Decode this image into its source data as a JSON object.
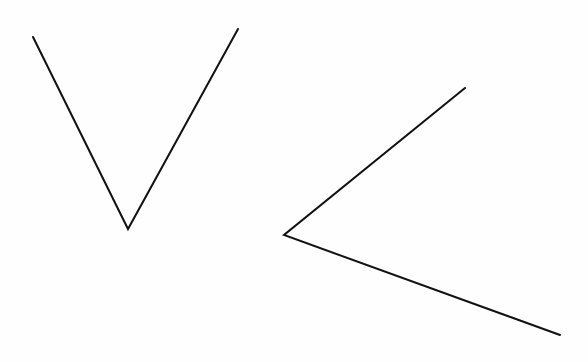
{
  "canvas": {
    "width": 588,
    "height": 362,
    "background": "#fefefe",
    "stroke_color": "#111111",
    "stroke_width": 2
  },
  "shapes": [
    {
      "name": "angle-v",
      "description": "V-shaped angle opening upward",
      "vertex": [
        128,
        229
      ],
      "arm_endpoints": [
        [
          33,
          37
        ],
        [
          238,
          29
        ]
      ]
    },
    {
      "name": "angle-left",
      "description": "Angle opening to the right",
      "vertex": [
        284,
        235
      ],
      "arm_endpoints": [
        [
          465,
          88
        ],
        [
          560,
          335
        ]
      ]
    }
  ]
}
